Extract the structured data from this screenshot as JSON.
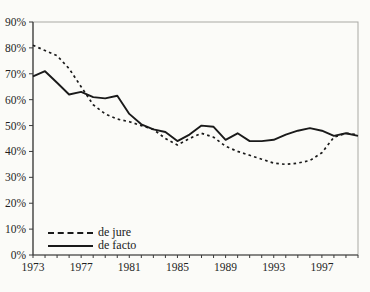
{
  "chart_data": {
    "type": "line",
    "title": "",
    "xlabel": "",
    "ylabel": "",
    "x": [
      1973,
      1974,
      1975,
      1976,
      1977,
      1978,
      1979,
      1980,
      1981,
      1982,
      1983,
      1984,
      1985,
      1986,
      1987,
      1988,
      1989,
      1990,
      1991,
      1992,
      1993,
      1994,
      1995,
      1996,
      1997,
      1998,
      1999,
      2000
    ],
    "x_tick_labels": [
      "1973",
      "1977",
      "1981",
      "1985",
      "1989",
      "1993",
      "1997"
    ],
    "y_tick_labels": [
      "0%",
      "10%",
      "20%",
      "30%",
      "40%",
      "50%",
      "60%",
      "70%",
      "80%",
      "90%"
    ],
    "ylim": [
      0,
      90
    ],
    "grid": false,
    "legend_position": "inside-bottom-left",
    "series": [
      {
        "name": "de jure",
        "line_style": "dashed",
        "color": "#1a1a1a",
        "values": [
          81,
          79,
          77,
          72,
          65,
          58,
          54.5,
          52.5,
          51.5,
          50,
          48.5,
          45,
          42.5,
          45,
          47,
          45.5,
          42,
          40,
          38.5,
          37,
          35.5,
          35,
          35.5,
          36.5,
          39.5,
          45.5,
          47,
          46.5
        ]
      },
      {
        "name": "de facto",
        "line_style": "solid",
        "color": "#1a1a1a",
        "values": [
          69,
          71,
          66.5,
          62,
          63,
          61,
          60.5,
          61.5,
          54.5,
          50.5,
          48.5,
          47.5,
          44,
          46.5,
          50,
          49.5,
          44.5,
          47,
          44,
          44,
          44.5,
          46.5,
          48,
          49,
          48,
          46,
          47,
          46
        ]
      }
    ]
  },
  "colors": {
    "axis": "#3a3a3a",
    "plot_border": "#a9a9a4",
    "background": "#fbfbf8",
    "tick_text": "#1f1f1f"
  }
}
